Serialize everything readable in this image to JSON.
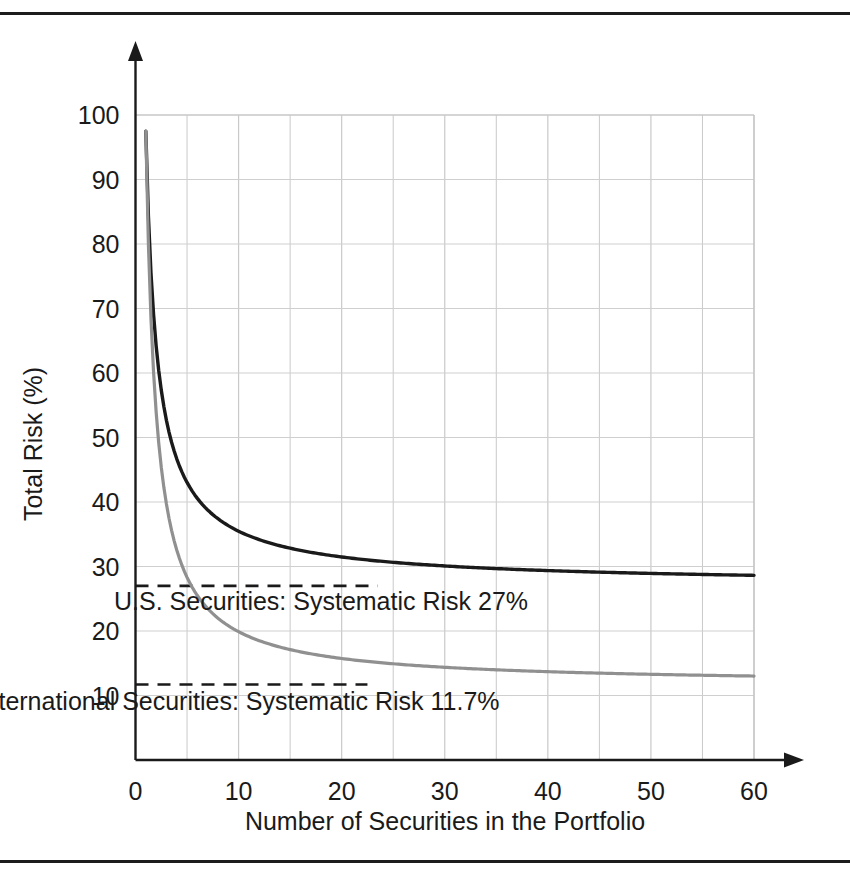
{
  "figure": {
    "background_color": "#ffffff",
    "frame_rule_color": "#1c1c1c"
  },
  "chart_data": {
    "type": "line",
    "title": "",
    "xlabel": "Number of Securities in the Portfolio",
    "ylabel": "Total Risk (%)",
    "xlim": [
      0,
      60
    ],
    "ylim": [
      0,
      100
    ],
    "xticks": [
      0,
      10,
      20,
      30,
      40,
      50,
      60
    ],
    "yticks": [
      10,
      20,
      30,
      40,
      50,
      60,
      70,
      80,
      90,
      100
    ],
    "grid": true,
    "grid_minor_x_step": 5,
    "legend": "none",
    "x": [
      1,
      2,
      3,
      4,
      5,
      6,
      7,
      8,
      9,
      10,
      12,
      14,
      16,
      18,
      20,
      23,
      25,
      30,
      35,
      40,
      45,
      50,
      55,
      60
    ],
    "series": [
      {
        "name": "U.S. Securities",
        "color": "#1a1a1a",
        "asymptote": 27,
        "asymptote_label": "U.S. Securities:  Systematic Risk 27%",
        "values": [
          97.5,
          71.0,
          60.5,
          54.5,
          50.3,
          47.2,
          44.8,
          42.8,
          41.2,
          39.8,
          37.6,
          35.9,
          34.5,
          33.4,
          32.4,
          31.2,
          30.5,
          29.2,
          28.4,
          27.9,
          27.5,
          27.2,
          27.1,
          27.0
        ]
      },
      {
        "name": "International Securities",
        "color": "#909090",
        "asymptote": 11.7,
        "asymptote_label": "International Securities:  Systematic Risk 11.7%",
        "values": [
          97.5,
          66.0,
          53.0,
          45.5,
          40.4,
          36.7,
          33.8,
          31.5,
          29.6,
          28.0,
          25.4,
          23.4,
          21.8,
          20.5,
          19.3,
          17.9,
          17.1,
          15.5,
          14.4,
          13.6,
          13.0,
          12.6,
          12.2,
          11.9
        ]
      }
    ],
    "annotations": [
      {
        "text": "U.S. Securities:  Systematic Risk 27%",
        "x": 18,
        "y": 23.3
      },
      {
        "text": "International Securities:  Systematic Risk 11.7%",
        "x": 10,
        "y": 7.8
      }
    ],
    "xtick_labels": [
      "0",
      "10",
      "20",
      "30",
      "40",
      "50",
      "60"
    ],
    "ytick_labels": [
      "10",
      "20",
      "30",
      "40",
      "50",
      "60",
      "70",
      "80",
      "90",
      "100"
    ]
  }
}
